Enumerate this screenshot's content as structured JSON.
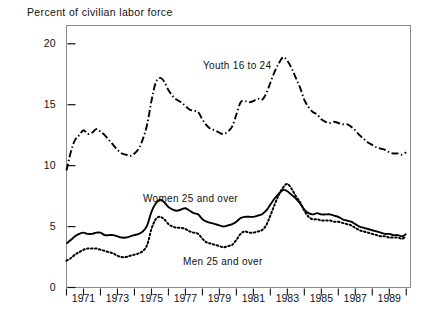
{
  "chart_data": {
    "type": "line",
    "title": "",
    "ylabel": "Percent of civilian labor force",
    "xlabel": "",
    "ylim": [
      0,
      21.5
    ],
    "xlim": [
      1970,
      1990.25
    ],
    "yticks": [
      0,
      5,
      10,
      15,
      20
    ],
    "ytick_labels": [
      "0",
      "5",
      "10",
      "15",
      "20"
    ],
    "xticks": [
      1970,
      1971,
      1972,
      1973,
      1974,
      1975,
      1976,
      1977,
      1978,
      1979,
      1980,
      1981,
      1982,
      1983,
      1984,
      1985,
      1986,
      1987,
      1988,
      1989,
      1990
    ],
    "xtick_labels": [
      "1971",
      "1973",
      "1975",
      "1977",
      "1979",
      "1981",
      "1983",
      "1985",
      "1987",
      "1989"
    ],
    "xtick_label_years": [
      1971,
      1973,
      1975,
      1977,
      1979,
      1981,
      1983,
      1985,
      1987,
      1989
    ],
    "grid": false,
    "legend_position": "inline-annotations",
    "series": [
      {
        "name": "Youth 16 to 24",
        "label": "Youth 16 to 24",
        "style": "dash-dot",
        "color": "#000000",
        "x": [
          1970.0,
          1970.25,
          1970.5,
          1970.75,
          1971.0,
          1971.25,
          1971.5,
          1971.75,
          1972.0,
          1972.25,
          1972.5,
          1972.75,
          1973.0,
          1973.25,
          1973.5,
          1973.75,
          1974.0,
          1974.25,
          1974.5,
          1974.75,
          1975.0,
          1975.25,
          1975.5,
          1975.75,
          1976.0,
          1976.25,
          1976.5,
          1976.75,
          1977.0,
          1977.25,
          1977.5,
          1977.75,
          1978.0,
          1978.25,
          1978.5,
          1978.75,
          1979.0,
          1979.25,
          1979.5,
          1979.75,
          1980.0,
          1980.25,
          1980.5,
          1980.75,
          1981.0,
          1981.25,
          1981.5,
          1981.75,
          1982.0,
          1982.25,
          1982.5,
          1982.75,
          1983.0,
          1983.25,
          1983.5,
          1983.75,
          1984.0,
          1984.25,
          1984.5,
          1984.75,
          1985.0,
          1985.25,
          1985.5,
          1985.75,
          1986.0,
          1986.25,
          1986.5,
          1986.75,
          1987.0,
          1987.25,
          1987.5,
          1987.75,
          1988.0,
          1988.25,
          1988.5,
          1988.75,
          1989.0,
          1989.25,
          1989.5,
          1989.75,
          1990.0
        ],
        "values": [
          9.6,
          11.1,
          12.1,
          12.5,
          12.9,
          12.6,
          12.7,
          13.0,
          12.8,
          12.5,
          12.1,
          11.7,
          11.3,
          11.0,
          10.9,
          10.8,
          11.0,
          11.4,
          12.2,
          13.4,
          15.3,
          16.8,
          17.2,
          16.9,
          16.2,
          15.7,
          15.4,
          15.2,
          14.9,
          14.6,
          14.5,
          14.4,
          13.8,
          13.3,
          13.0,
          12.9,
          12.7,
          12.6,
          12.8,
          13.2,
          14.2,
          15.2,
          15.3,
          15.2,
          15.3,
          15.5,
          15.4,
          15.9,
          16.8,
          17.7,
          18.4,
          18.9,
          18.6,
          18.0,
          17.2,
          16.4,
          15.4,
          14.8,
          14.4,
          14.2,
          13.8,
          13.6,
          13.5,
          13.6,
          13.5,
          13.4,
          13.4,
          13.2,
          12.9,
          12.5,
          12.2,
          11.9,
          11.7,
          11.5,
          11.4,
          11.3,
          11.1,
          11.0,
          11.0,
          10.9,
          11.1
        ]
      },
      {
        "name": "Women 25 and over",
        "label": "Women 25 and over",
        "style": "solid",
        "color": "#000000",
        "x": [
          1970.0,
          1970.25,
          1970.5,
          1970.75,
          1971.0,
          1971.25,
          1971.5,
          1971.75,
          1972.0,
          1972.25,
          1972.5,
          1972.75,
          1973.0,
          1973.25,
          1973.5,
          1973.75,
          1974.0,
          1974.25,
          1974.5,
          1974.75,
          1975.0,
          1975.25,
          1975.5,
          1975.75,
          1976.0,
          1976.25,
          1976.5,
          1976.75,
          1977.0,
          1977.25,
          1977.5,
          1977.75,
          1978.0,
          1978.25,
          1978.5,
          1978.75,
          1979.0,
          1979.25,
          1979.5,
          1979.75,
          1980.0,
          1980.25,
          1980.5,
          1980.75,
          1981.0,
          1981.25,
          1981.5,
          1981.75,
          1982.0,
          1982.25,
          1982.5,
          1982.75,
          1983.0,
          1983.25,
          1983.5,
          1983.75,
          1984.0,
          1984.25,
          1984.5,
          1984.75,
          1985.0,
          1985.25,
          1985.5,
          1985.75,
          1986.0,
          1986.25,
          1986.5,
          1986.75,
          1987.0,
          1987.25,
          1987.5,
          1987.75,
          1988.0,
          1988.25,
          1988.5,
          1988.75,
          1989.0,
          1989.25,
          1989.5,
          1989.75,
          1990.0
        ],
        "values": [
          3.6,
          3.9,
          4.2,
          4.4,
          4.5,
          4.4,
          4.4,
          4.5,
          4.5,
          4.3,
          4.3,
          4.3,
          4.2,
          4.1,
          4.1,
          4.2,
          4.3,
          4.4,
          4.6,
          5.1,
          6.2,
          6.9,
          7.2,
          7.0,
          6.6,
          6.4,
          6.3,
          6.4,
          6.5,
          6.3,
          6.1,
          6.0,
          5.6,
          5.4,
          5.3,
          5.2,
          5.1,
          5.0,
          5.1,
          5.2,
          5.4,
          5.7,
          5.8,
          5.8,
          5.8,
          5.9,
          6.0,
          6.3,
          6.8,
          7.3,
          7.7,
          8.0,
          7.9,
          7.6,
          7.3,
          6.9,
          6.4,
          6.1,
          6.0,
          6.1,
          6.0,
          6.0,
          6.0,
          5.9,
          5.8,
          5.6,
          5.5,
          5.4,
          5.2,
          5.0,
          4.9,
          4.8,
          4.7,
          4.6,
          4.5,
          4.4,
          4.4,
          4.3,
          4.3,
          4.2,
          4.4
        ]
      },
      {
        "name": "Men 25 and over",
        "label": "Men 25 and over",
        "style": "dotted",
        "color": "#000000",
        "x": [
          1970.0,
          1970.25,
          1970.5,
          1970.75,
          1971.0,
          1971.25,
          1971.5,
          1971.75,
          1972.0,
          1972.25,
          1972.5,
          1972.75,
          1973.0,
          1973.25,
          1973.5,
          1973.75,
          1974.0,
          1974.25,
          1974.5,
          1974.75,
          1975.0,
          1975.25,
          1975.5,
          1975.75,
          1976.0,
          1976.25,
          1976.5,
          1976.75,
          1977.0,
          1977.25,
          1977.5,
          1977.75,
          1978.0,
          1978.25,
          1978.5,
          1978.75,
          1979.0,
          1979.25,
          1979.5,
          1979.75,
          1980.0,
          1980.25,
          1980.5,
          1980.75,
          1981.0,
          1981.25,
          1981.5,
          1981.75,
          1982.0,
          1982.25,
          1982.5,
          1982.75,
          1983.0,
          1983.25,
          1983.5,
          1983.75,
          1984.0,
          1984.25,
          1984.5,
          1984.75,
          1985.0,
          1985.25,
          1985.5,
          1985.75,
          1986.0,
          1986.25,
          1986.5,
          1986.75,
          1987.0,
          1987.25,
          1987.5,
          1987.75,
          1988.0,
          1988.25,
          1988.5,
          1988.75,
          1989.0,
          1989.25,
          1989.5,
          1989.75,
          1990.0
        ],
        "values": [
          2.2,
          2.4,
          2.7,
          2.9,
          3.1,
          3.2,
          3.2,
          3.2,
          3.1,
          3.0,
          2.9,
          2.8,
          2.6,
          2.5,
          2.5,
          2.6,
          2.7,
          2.8,
          3.0,
          3.5,
          4.8,
          5.6,
          5.8,
          5.6,
          5.2,
          5.0,
          4.9,
          4.9,
          4.8,
          4.6,
          4.5,
          4.4,
          4.0,
          3.7,
          3.6,
          3.5,
          3.4,
          3.3,
          3.4,
          3.5,
          3.9,
          4.4,
          4.6,
          4.5,
          4.5,
          4.6,
          4.7,
          5.1,
          5.9,
          6.8,
          7.6,
          8.2,
          8.5,
          8.1,
          7.5,
          7.0,
          6.3,
          5.8,
          5.6,
          5.6,
          5.5,
          5.5,
          5.5,
          5.4,
          5.4,
          5.3,
          5.2,
          5.1,
          4.9,
          4.7,
          4.6,
          4.5,
          4.4,
          4.3,
          4.2,
          4.2,
          4.1,
          4.1,
          4.1,
          4.0,
          4.2
        ]
      }
    ]
  }
}
